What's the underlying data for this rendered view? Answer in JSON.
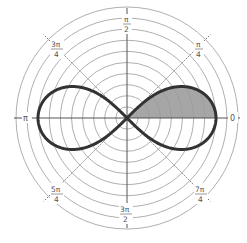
{
  "figure": {
    "title": "",
    "center": {
      "x": 127,
      "y": 118
    },
    "grid": {
      "circle_count": 9,
      "circle_spacing_px": 11.1,
      "circle_color": "#9a9a9a",
      "axis_color": "#555555",
      "diagonal_style": "dotted"
    },
    "curve": {
      "name": "lemniscate",
      "equation": "r^2 = a^2 cos(2θ)",
      "a_px": 89,
      "stroke_color": "#333333",
      "stroke_width": 3
    },
    "shaded_region": {
      "theta_from": "0",
      "theta_to": "π/4",
      "fill_color": "#a6a6a6"
    },
    "angle_labels": {
      "right": {
        "text": "0"
      },
      "top": {
        "num": "π",
        "den": "2"
      },
      "left": {
        "text": "π"
      },
      "bottom": {
        "num": "3π",
        "den": "2"
      },
      "q1": {
        "num": "π",
        "den": "4"
      },
      "q2": {
        "num": "3π",
        "den": "4"
      },
      "q3": {
        "num": "5π",
        "den": "4"
      },
      "q4": {
        "num": "7π",
        "den": "4"
      }
    }
  }
}
